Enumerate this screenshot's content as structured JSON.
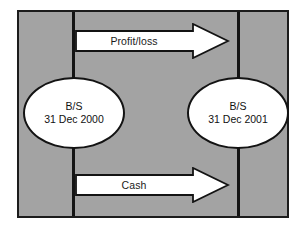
{
  "diagram": {
    "type": "flow-diagram",
    "background_color": "#a3a3a3",
    "frame_border_color": "#1c1c1c",
    "divider_color": "#141414",
    "arrow_fill_color": "#ffffff",
    "arrow_outline_color": "#131313",
    "node_fill_color": "#ffffff",
    "node_outline_color": "#131313",
    "margin_fragments": [
      {
        "text": "t"
      },
      {
        "text": "t"
      }
    ],
    "dividers": [
      {
        "id": "period-start-divider"
      },
      {
        "id": "period-end-divider"
      }
    ],
    "arrows": [
      {
        "id": "profit-loss-arrow",
        "label": "Profit/loss",
        "direction": "right"
      },
      {
        "id": "cash-arrow",
        "label": "Cash",
        "direction": "right"
      }
    ],
    "nodes": [
      {
        "id": "balance-sheet-opening",
        "line1": "B/S",
        "line2": "31 Dec 2000"
      },
      {
        "id": "balance-sheet-closing",
        "line1": "B/S",
        "line2": "31 Dec 2001"
      }
    ]
  }
}
